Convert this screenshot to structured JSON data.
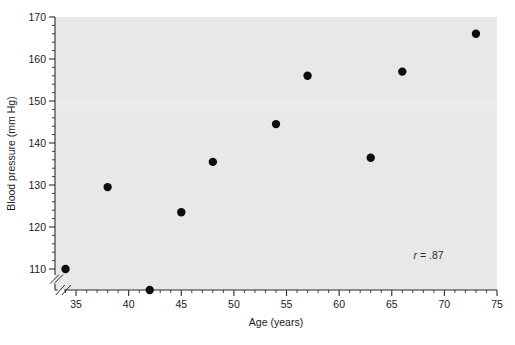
{
  "chart_data": {
    "type": "scatter",
    "title": "",
    "xlabel": "Age (years)",
    "ylabel": "Blood pressure (mm Hg)",
    "xlim": [
      33,
      75
    ],
    "ylim": [
      105,
      170
    ],
    "x_major_ticks": [
      35,
      40,
      45,
      50,
      55,
      60,
      65,
      70,
      75
    ],
    "x_tick_labels": [
      "35",
      "40",
      "45",
      "50",
      "55",
      "60",
      "65",
      "70",
      "75"
    ],
    "x_minor_tick_step": 1,
    "y_major_ticks": [
      110,
      120,
      130,
      140,
      150,
      160,
      170
    ],
    "y_tick_labels": [
      "110",
      "120",
      "130",
      "140",
      "150",
      "160",
      "170"
    ],
    "y_minor_tick_step": 2,
    "x_axis_break": true,
    "y_axis_break": true,
    "grid": false,
    "legend": "none",
    "marker": "filled-circle",
    "marker_color": "#0d0d0d",
    "plot_background": "#e8e8e8",
    "x": [
      34,
      38,
      42,
      45,
      48,
      54,
      57,
      63,
      66,
      73
    ],
    "y": [
      110,
      129.5,
      105,
      123.5,
      135.5,
      144.5,
      156,
      136.5,
      157,
      166
    ],
    "points": [
      {
        "age": 34,
        "bp": 110
      },
      {
        "age": 38,
        "bp": 129.5
      },
      {
        "age": 42,
        "bp": 105
      },
      {
        "age": 45,
        "bp": 123.5
      },
      {
        "age": 48,
        "bp": 135.5
      },
      {
        "age": 54,
        "bp": 144.5
      },
      {
        "age": 57,
        "bp": 156
      },
      {
        "age": 63,
        "bp": 136.5
      },
      {
        "age": 66,
        "bp": 157
      },
      {
        "age": 73,
        "bp": 166
      }
    ],
    "annotations": [
      {
        "name": "correlation",
        "symbol": "r",
        "text": " = .87",
        "full_text": "r = .87",
        "x": 68.5,
        "y": 112.5
      }
    ]
  }
}
